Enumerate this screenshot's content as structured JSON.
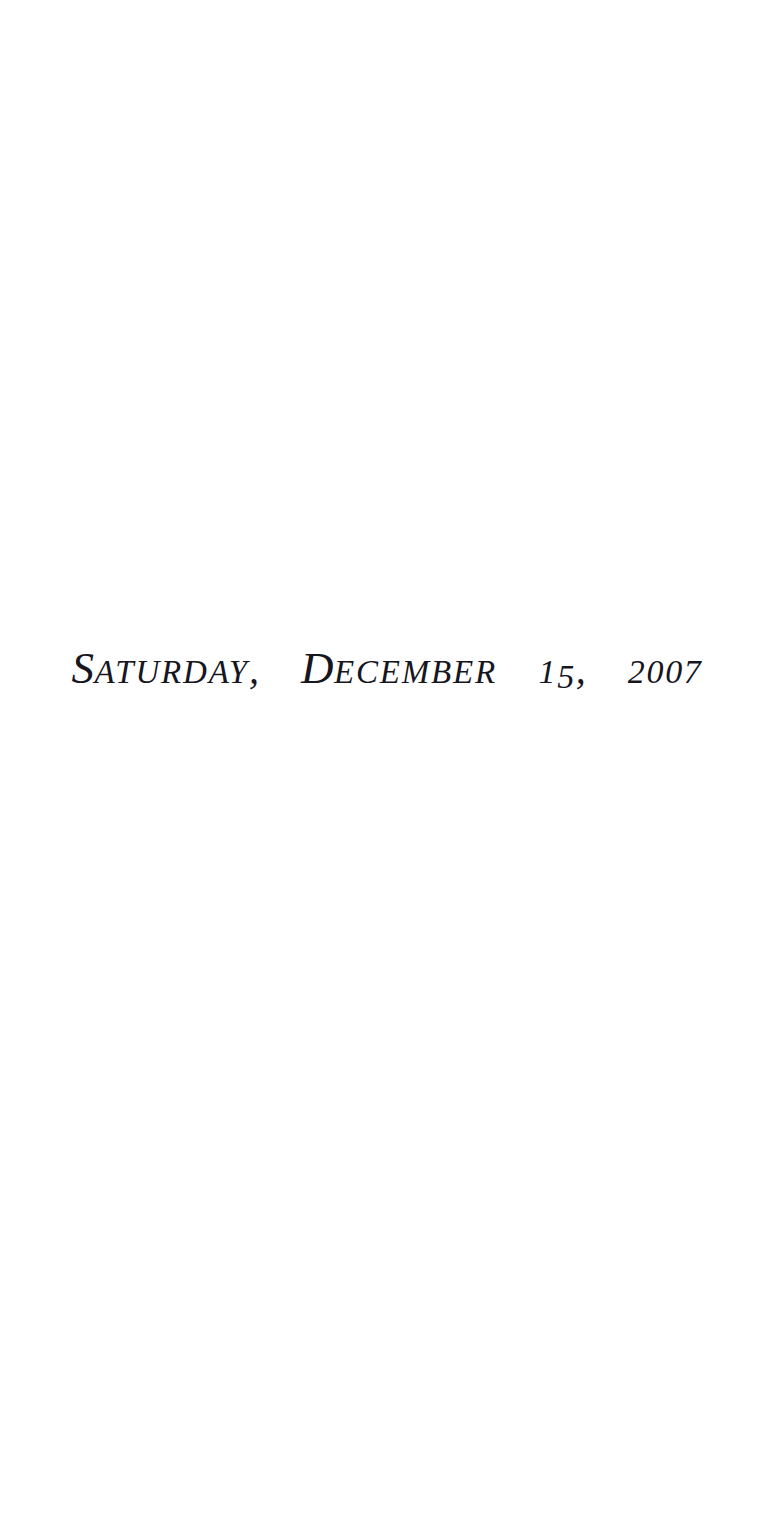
{
  "page": {
    "kind": "scanned-book-divider-page",
    "width": 782,
    "height": 1514,
    "background_color": "#ffffff",
    "ink_color": "#16161e"
  },
  "date_line": {
    "full_text": "SATURDAY, DECEMBER 15, 2007",
    "weekday": {
      "initial": "S",
      "rest": "ATURDAY"
    },
    "comma_after_weekday": ",",
    "month": {
      "initial": "D",
      "rest": "ECEMBER"
    },
    "day": {
      "digit_1": "1",
      "digit_2": "5"
    },
    "comma_after_day": ",",
    "year": {
      "digit_1": "2",
      "digit_2": "0",
      "digit_3": "0",
      "digit_4": "7"
    }
  }
}
